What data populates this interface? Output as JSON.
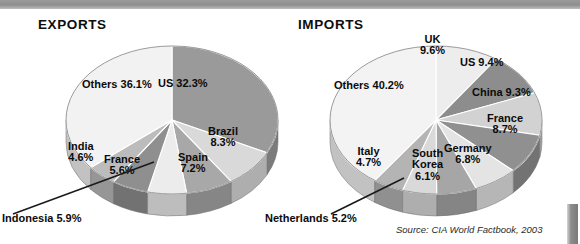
{
  "document": {
    "source_note": "Source: CIA World Factbook, 2003"
  },
  "charts": {
    "exports": {
      "title": "EXPORTS",
      "labels": {
        "us": "US 32.3%",
        "brazil": "Brazil\n8.3%",
        "spain": "Spain\n7.2%",
        "france": "France\n5.6%",
        "india": "India\n4.6%",
        "others": "Others 36.1%",
        "indonesia_callout": "Indonesia 5.9%"
      }
    },
    "imports": {
      "title": "IMPORTS",
      "labels": {
        "uk": "UK\n9.6%",
        "us": "US 9.4%",
        "china": "China 9.3%",
        "france": "France\n8.7%",
        "germany": "Germany\n6.8%",
        "south_korea": "South\nKorea\n6.1%",
        "italy": "Italy\n4.7%",
        "others": "Others 40.2%",
        "netherlands_callout": "Netherlands 5.2%"
      }
    }
  },
  "chart_data": [
    {
      "type": "pie",
      "title": "EXPORTS",
      "legend_position": "inside-slices",
      "units": "percent",
      "categories": [
        "US",
        "Brazil",
        "Spain",
        "Indonesia",
        "France",
        "India",
        "Others"
      ],
      "values": [
        32.3,
        8.3,
        7.2,
        5.9,
        5.6,
        4.6,
        36.1
      ],
      "labels": [
        "US 32.3%",
        "Brazil 8.3%",
        "Spain 7.2%",
        "Indonesia 5.9%",
        "France 5.6%",
        "India 4.6%",
        "Others 36.1%"
      ],
      "colors": [
        "#9a9a9a",
        "#d9d9d9",
        "#a8a8a8",
        "#ececec",
        "#8f8f8f",
        "#bcbcbc",
        "#f2f2f2"
      ],
      "start_angle_deg": 0,
      "direction": "clockwise",
      "three_d": true,
      "callouts": [
        "Indonesia 5.9%"
      ]
    },
    {
      "type": "pie",
      "title": "IMPORTS",
      "legend_position": "inside-slices",
      "units": "percent",
      "categories": [
        "UK",
        "US",
        "China",
        "France",
        "Germany",
        "South Korea",
        "Netherlands",
        "Italy",
        "Others"
      ],
      "values": [
        9.6,
        9.4,
        9.3,
        8.7,
        6.8,
        6.1,
        5.2,
        4.7,
        40.2
      ],
      "labels": [
        "UK 9.6%",
        "US 9.4%",
        "China 9.3%",
        "France 8.7%",
        "Germany 6.8%",
        "South Korea 6.1%",
        "Netherlands 5.2%",
        "Italy 4.7%",
        "Others 40.2%"
      ],
      "colors": [
        "#ededed",
        "#8d8d8d",
        "#d2d2d2",
        "#909090",
        "#e4e4e4",
        "#a6a6a6",
        "#d9d9d9",
        "#b4b4b4",
        "#f3f3f3"
      ],
      "start_angle_deg": 0,
      "direction": "clockwise",
      "three_d": true,
      "callouts": [
        "Netherlands 5.2%"
      ]
    }
  ],
  "palette": {
    "background": "#ffffff",
    "text": "#0b0b0b",
    "banner": "#8e8e8e",
    "outline": "#3a3a3a"
  }
}
